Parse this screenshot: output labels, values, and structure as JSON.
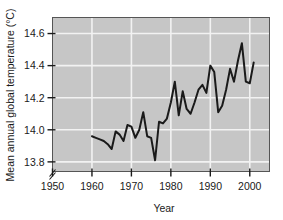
{
  "chart_data": {
    "type": "line",
    "title": "",
    "xlabel": "Year",
    "ylabel": "Mean annual global temperature (°C)",
    "xlim": [
      1950,
      2005
    ],
    "ylim": [
      13.74,
      14.7
    ],
    "y_axis_break": true,
    "grid": true,
    "legend": "none",
    "xticks": [
      1950,
      1960,
      1970,
      1980,
      1990,
      2000
    ],
    "xtick_labels": [
      "1950",
      "1960",
      "1970",
      "1980",
      "1990",
      "2000"
    ],
    "yticks": [
      13.8,
      14.0,
      14.2,
      14.4,
      14.6
    ],
    "ytick_labels": [
      "13.8",
      "14.0",
      "14.2",
      "14.4",
      "14.6"
    ],
    "series": [
      {
        "name": "Mean annual global temperature",
        "x": [
          1960,
          1961,
          1962,
          1963,
          1964,
          1965,
          1966,
          1967,
          1968,
          1969,
          1970,
          1971,
          1972,
          1973,
          1974,
          1975,
          1976,
          1977,
          1978,
          1979,
          1980,
          1981,
          1982,
          1983,
          1984,
          1985,
          1986,
          1987,
          1988,
          1989,
          1990,
          1991,
          1992,
          1993,
          1994,
          1995,
          1996,
          1997,
          1998,
          1999,
          2000,
          2001
        ],
        "values": [
          13.96,
          13.95,
          13.94,
          13.93,
          13.91,
          13.88,
          13.99,
          13.97,
          13.93,
          14.03,
          14.02,
          13.95,
          14.0,
          14.11,
          13.96,
          13.95,
          13.81,
          14.05,
          14.04,
          14.07,
          14.17,
          14.3,
          14.09,
          14.24,
          14.13,
          14.1,
          14.17,
          14.25,
          14.28,
          14.23,
          14.4,
          14.36,
          14.11,
          14.15,
          14.25,
          14.38,
          14.3,
          14.43,
          14.54,
          14.3,
          14.29,
          14.42
        ]
      }
    ],
    "colors": {
      "plot_background": "#c6c6c6",
      "gridline": "#f2f2f2",
      "line": "#1a1a1a",
      "axis": "#1a1a1a",
      "page_background": "#ffffff"
    }
  }
}
